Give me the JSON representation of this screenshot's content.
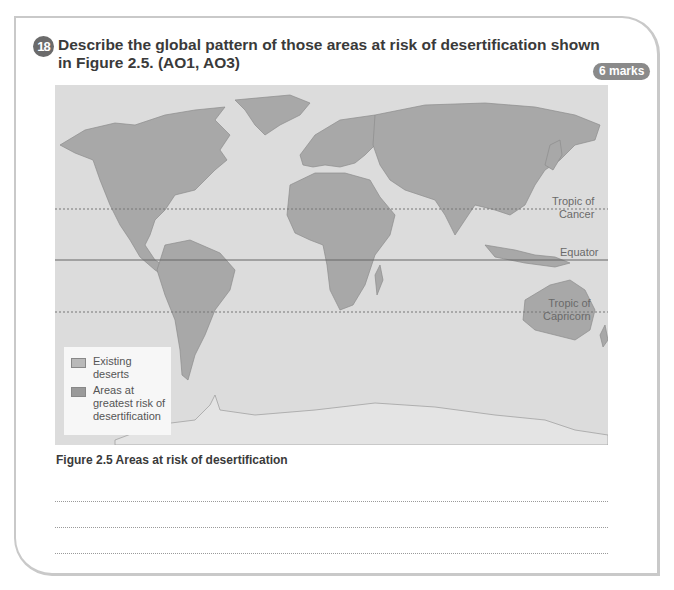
{
  "question": {
    "number": "18",
    "text_line1": "Describe the global pattern of those areas at risk of desertification shown",
    "text_line2": "in Figure 2.5. (AO1, AO3)",
    "marks": "6 marks"
  },
  "figure": {
    "caption": "Figure 2.5 Areas at risk of desertification",
    "lines": {
      "tropic_cancer_1": "Tropic of",
      "tropic_cancer_2": "Cancer",
      "equator": "Equator",
      "tropic_capricorn_1": "Tropic of",
      "tropic_capricorn_2": "Capricorn"
    },
    "legend": [
      {
        "label": "Existing deserts",
        "color": "#b9b9b9"
      },
      {
        "label": "Areas at greatest risk of desertification",
        "color": "#9a9a9a"
      }
    ]
  },
  "answer_lines": 3,
  "colors": {
    "ocean": "#dcdcdc",
    "land": "#a9a9a9",
    "badge": "#8a8a8a",
    "question_number": "#6b6b6b"
  }
}
